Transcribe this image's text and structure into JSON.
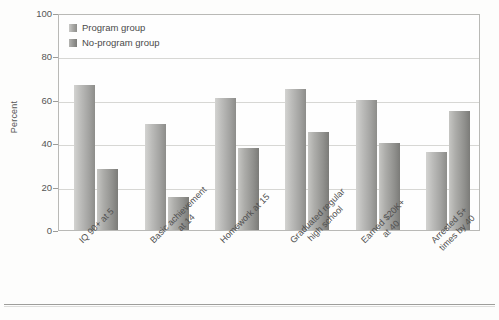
{
  "chart_data": {
    "type": "bar",
    "title": "",
    "xlabel": "",
    "ylabel": "Percent",
    "ylim": [
      0,
      100
    ],
    "yticks": [
      0,
      20,
      40,
      60,
      80,
      100
    ],
    "grid": true,
    "legend_position": "top-left-inside",
    "categories": [
      "IQ 90+ at 5",
      "Basic achievement at 14",
      "Homework at 15",
      "Graduated regular high school",
      "Earned $20K+ at 40",
      "Arrested 5+ times by 40"
    ],
    "category_lines": [
      [
        "IQ 90+ at 5"
      ],
      [
        "Basic achievement",
        "at 14"
      ],
      [
        "Homework at 15"
      ],
      [
        "Graduated regular",
        "high school"
      ],
      [
        "Earned $20K+",
        "at 40"
      ],
      [
        "Arrested 5+",
        "times by 40"
      ]
    ],
    "series": [
      {
        "name": "Program group",
        "color": "#a8a8a5",
        "values": [
          67,
          49,
          61,
          65,
          60,
          36
        ]
      },
      {
        "name": "No-program group",
        "color": "#91918e",
        "values": [
          28,
          15,
          38,
          45,
          40,
          55
        ]
      }
    ]
  },
  "axis": {
    "y_title": "Percent",
    "tick_labels": [
      "100",
      "80",
      "60",
      "40",
      "20",
      "0"
    ]
  },
  "legend": {
    "items": [
      {
        "label": "Program group",
        "swatch": "legend-swatch-program"
      },
      {
        "label": "No-program group",
        "swatch": "legend-swatch-no-program"
      }
    ]
  }
}
